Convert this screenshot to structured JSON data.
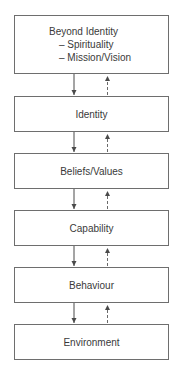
{
  "diagram": {
    "type": "hierarchy-flow",
    "levels": [
      {
        "label": "Beyond Identity",
        "sub_items": [
          "– Spirituality",
          "– Mission/Vision"
        ]
      },
      {
        "label": "Identity"
      },
      {
        "label": "Beliefs/Values"
      },
      {
        "label": "Capability"
      },
      {
        "label": "Behaviour"
      },
      {
        "label": "Environment"
      }
    ],
    "connectors": {
      "downward": "solid arrow (top-down influence)",
      "upward": "dashed arrow (bottom-up influence)"
    },
    "colors": {
      "border": "#6e6e6e",
      "text": "#3a3a3a",
      "arrow": "#4a4a4a",
      "background": "#ffffff"
    }
  }
}
